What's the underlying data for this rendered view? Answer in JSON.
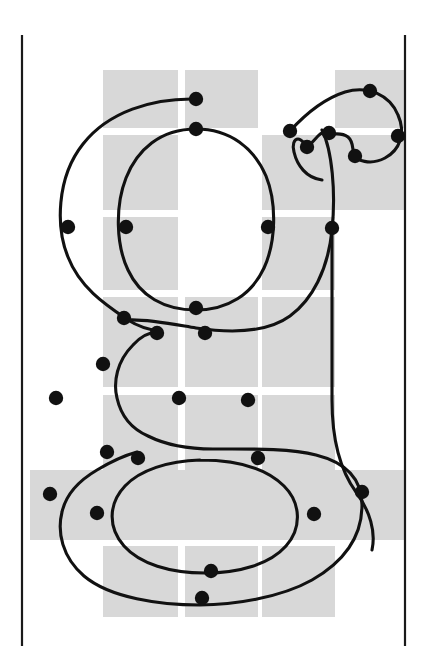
{
  "figure": {
    "kind": "typographic-outline-diagram",
    "width": 436,
    "height": 664,
    "background_color": "#ffffff",
    "grid_color": "#d8d8d8",
    "outline_color": "#111111",
    "node_color": "#111111",
    "sidebearing_color": "#1a1a1a"
  },
  "sidebearings": [
    {
      "name": "left-sidebearing-line",
      "x": 22,
      "y1": 35,
      "y2": 646
    },
    {
      "name": "right-sidebearing-line",
      "x": 405,
      "y1": 35,
      "y2": 646
    }
  ],
  "grid": {
    "columns": [
      {
        "x": 103,
        "width": 75
      },
      {
        "x": 185,
        "width": 73
      },
      {
        "x": 262,
        "width": 73
      },
      {
        "x": 335,
        "width": 70
      }
    ],
    "rows": [
      {
        "y": 70,
        "height": 58
      },
      {
        "y": 135,
        "height": 75
      },
      {
        "y": 217,
        "height": 73
      },
      {
        "y": 297,
        "height": 90
      },
      {
        "y": 395,
        "height": 75
      },
      {
        "y": 470,
        "height": 70
      },
      {
        "y": 546,
        "height": 71
      }
    ],
    "cells": [
      {
        "col": 0,
        "row": 0
      },
      {
        "col": 1,
        "row": 0
      },
      {
        "col": 3,
        "row": 0
      },
      {
        "col": 0,
        "row": 1
      },
      {
        "col": 2,
        "row": 1
      },
      {
        "col": 3,
        "row": 1
      },
      {
        "col": 0,
        "row": 2
      },
      {
        "col": 2,
        "row": 2
      },
      {
        "col": 0,
        "row": 3
      },
      {
        "col": 1,
        "row": 3
      },
      {
        "col": 2,
        "row": 3
      },
      {
        "col": 0,
        "row": 4
      },
      {
        "col": 1,
        "row": 4
      },
      {
        "col": 2,
        "row": 4
      },
      {
        "col": 1,
        "row": 5
      },
      {
        "col": 3,
        "row": 5
      },
      {
        "col": 0,
        "row": 6
      },
      {
        "col": 1,
        "row": 6
      },
      {
        "col": 2,
        "row": 6
      }
    ],
    "full_width_rows": [
      {
        "row": 5,
        "x": 30,
        "width": 375
      }
    ]
  },
  "outlines": {
    "outer": "M 196 99 C 152 98 108 112 83 144 C 56 178 56 228 68 257 C 80 288 106 305 128 320 C 139 327 150 330 160 331 C 150 332 140 337 133 345 C 117 361 113 382 117 398 C 121 416 132 429 148 436 C 170 447 196 449 213 449 C 247 449 290 448 316 455 C 344 462 362 477 362 505 C 362 540 340 564 312 580 C 280 598 232 605 200 605 C 160 605 110 598 84 576 C 62 557 57 532 62 512 C 66 494 80 480 97 470 C 112 461 126 455 137 452",
    "bowl": "M 196 129 C 160 129 137 150 126 178 C 115 206 116 245 128 270 C 140 296 164 310 196 310 C 228 310 252 294 264 268 C 276 242 277 203 266 176 C 254 148 230 129 196 129",
    "tail_upper": "M 128 320 C 148 319 172 324 196 328 C 236 334 268 332 290 316 C 312 300 328 270 332 230 C 336 192 332 150 322 130",
    "ear": "M 290 131 C 300 120 320 100 345 92 C 368 85 390 95 398 115 C 406 133 400 150 385 158 C 370 166 356 160 354 155 C 352 149 354 142 348 137 C 340 131 332 136 329 133 C 326 130 322 132 318 136 C 313 141 310 146 307 145 C 304 144 302 139 298 139 C 294 139 292 145 294 152 C 297 165 306 178 322 180",
    "counter": "M 200 460 C 168 461 140 470 125 486 C 108 504 108 528 124 546 C 140 564 170 573 205 573 C 240 573 270 564 286 546 C 302 528 301 503 284 486 C 268 470 240 460 200 460",
    "stem_right": "M 332 230 C 332 280 332 340 332 400 C 332 440 340 470 356 492 C 370 511 376 532 372 550"
  },
  "nodes": [
    {
      "id": "n1",
      "x": 196,
      "y": 99,
      "label": "outer-top"
    },
    {
      "id": "n2",
      "x": 196,
      "y": 129,
      "label": "bowl-top"
    },
    {
      "id": "n3",
      "x": 68,
      "y": 227,
      "label": "outer-left"
    },
    {
      "id": "n4",
      "x": 126,
      "y": 227,
      "label": "bowl-left"
    },
    {
      "id": "n5",
      "x": 268,
      "y": 227,
      "label": "bowl-right"
    },
    {
      "id": "n6",
      "x": 332,
      "y": 228,
      "label": "outer-right"
    },
    {
      "id": "n7",
      "x": 196,
      "y": 308,
      "label": "bowl-bottom"
    },
    {
      "id": "n8",
      "x": 290,
      "y": 131,
      "label": "ear-join"
    },
    {
      "id": "n9",
      "x": 329,
      "y": 133,
      "label": "ear-notch-a"
    },
    {
      "id": "n10",
      "x": 307,
      "y": 147,
      "label": "ear-notch-b"
    },
    {
      "id": "n11",
      "x": 355,
      "y": 156,
      "label": "ear-inner-bottom"
    },
    {
      "id": "n12",
      "x": 398,
      "y": 136,
      "label": "ear-right"
    },
    {
      "id": "n13",
      "x": 370,
      "y": 91,
      "label": "ear-top"
    },
    {
      "id": "n14",
      "x": 124,
      "y": 318,
      "label": "link-left-upper"
    },
    {
      "id": "n15",
      "x": 157,
      "y": 333,
      "label": "link-node-a"
    },
    {
      "id": "n16",
      "x": 205,
      "y": 333,
      "label": "link-node-b"
    },
    {
      "id": "n17",
      "x": 103,
      "y": 364,
      "label": "link-left-curve"
    },
    {
      "id": "n18",
      "x": 56,
      "y": 398,
      "label": "spur-left"
    },
    {
      "id": "n19",
      "x": 179,
      "y": 398,
      "label": "descender-mid-a"
    },
    {
      "id": "n20",
      "x": 248,
      "y": 400,
      "label": "descender-mid-b"
    },
    {
      "id": "n21",
      "x": 107,
      "y": 452,
      "label": "link-left-lower"
    },
    {
      "id": "n22",
      "x": 138,
      "y": 458,
      "label": "counter-top-left"
    },
    {
      "id": "n23",
      "x": 258,
      "y": 458,
      "label": "counter-top-right"
    },
    {
      "id": "n24",
      "x": 362,
      "y": 492,
      "label": "outer-right-lower"
    },
    {
      "id": "n25",
      "x": 50,
      "y": 494,
      "label": "outer-left-lower"
    },
    {
      "id": "n26",
      "x": 97,
      "y": 513,
      "label": "counter-left"
    },
    {
      "id": "n27",
      "x": 314,
      "y": 514,
      "label": "counter-right"
    },
    {
      "id": "n28",
      "x": 211,
      "y": 571,
      "label": "counter-bottom"
    },
    {
      "id": "n29",
      "x": 202,
      "y": 598,
      "label": "outer-bottom"
    }
  ]
}
